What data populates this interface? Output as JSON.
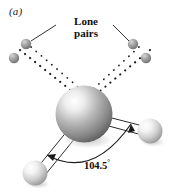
{
  "figure": {
    "panel_label": "(a)",
    "molecule": "water",
    "background_color": "#ffffff"
  },
  "annotations": {
    "lone_pairs_label_line1": "Lone",
    "lone_pairs_label_line2": "pairs",
    "bond_angle_value": "104.5",
    "bond_angle_degree_symbol": "°"
  },
  "colors": {
    "central_atom_dark": "#6f6f6f",
    "central_atom_mid": "#a8a8a8",
    "central_atom_light": "#fcfcfc",
    "hydrogen_dark": "#9a9a9a",
    "hydrogen_light": "#ffffff",
    "lone_pair_dark": "#7a7a7a",
    "lone_pair_light": "#b9b9b9",
    "line_color": "#1a1a1a",
    "bond_outline": "#2b2b2b",
    "bond_fill": "#ffffff",
    "shadow": "#c9c9c9"
  },
  "atoms": {
    "oxygen": {
      "cx": 84,
      "cy": 114,
      "r": 28
    },
    "hydrogen_left": {
      "cx": 35,
      "cy": 173,
      "r": 12
    },
    "hydrogen_right": {
      "cx": 150,
      "cy": 131,
      "r": 12
    }
  },
  "lone_pairs": {
    "left_upper": {
      "cx": 26,
      "cy": 44,
      "r": 5
    },
    "left_lower": {
      "cx": 14,
      "cy": 58,
      "r": 5
    },
    "right_upper": {
      "cx": 133,
      "cy": 44,
      "r": 5
    },
    "right_lower": {
      "cx": 146,
      "cy": 58,
      "r": 5
    }
  },
  "leader_lines": {
    "left": {
      "x1": 56,
      "y1": 24,
      "x2": 31,
      "y2": 41
    },
    "right": {
      "x1": 113,
      "y1": 24,
      "x2": 129,
      "y2": 41
    }
  },
  "angle_arc": {
    "start_x": 44,
    "start_y": 154,
    "end_x": 131,
    "end_y": 122,
    "control_x": 92,
    "control_y": 172
  }
}
